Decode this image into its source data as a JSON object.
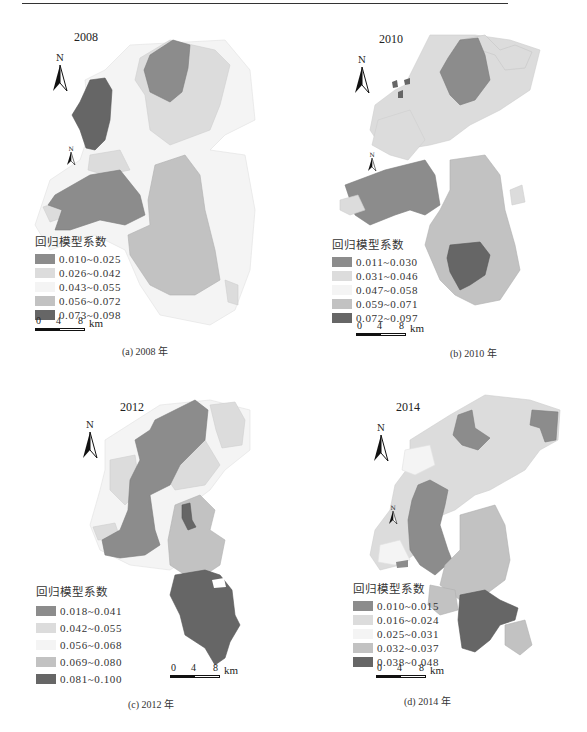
{
  "figure": {
    "colors": {
      "class1": "#8c8c8c",
      "class2": "#dcdcdc",
      "class3": "#f4f4f4",
      "class4": "#c2c2c2",
      "class5": "#666666"
    },
    "legend_title": "回归模型系数",
    "scale": {
      "t0": "0",
      "t1": "4",
      "t2": "8",
      "unit": "km"
    },
    "north_label": "N"
  },
  "panels": [
    {
      "year": "2008",
      "caption": "(a) 2008 年",
      "legend": [
        "0.010~0.025",
        "0.026~0.042",
        "0.043~0.055",
        "0.056~0.072",
        "0.073~0.098"
      ]
    },
    {
      "year": "2010",
      "caption": "(b) 2010 年",
      "legend": [
        "0.011~0.030",
        "0.031~0.046",
        "0.047~0.058",
        "0.059~0.071",
        "0.072~0.097"
      ]
    },
    {
      "year": "2012",
      "caption": "(c) 2012 年",
      "legend": [
        "0.018~0.041",
        "0.042~0.055",
        "0.056~0.068",
        "0.069~0.080",
        "0.081~0.100"
      ]
    },
    {
      "year": "2014",
      "caption": "(d) 2014 年",
      "legend": [
        "0.010~0.015",
        "0.016~0.024",
        "0.025~0.031",
        "0.032~0.037",
        "0.038~0.048"
      ]
    }
  ]
}
